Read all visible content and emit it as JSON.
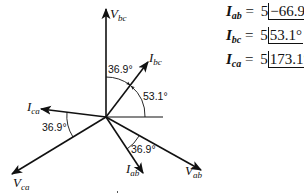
{
  "diagram": {
    "type": "phasor",
    "origin": [
      106,
      117
    ],
    "phasors": [
      {
        "name": "V_bc",
        "var": "V",
        "sub": "bc",
        "tip": [
          106,
          9
        ],
        "label_pos": [
          110,
          18
        ]
      },
      {
        "name": "I_bc",
        "var": "I",
        "sub": "bc",
        "tip": [
          148,
          62
        ],
        "label_pos": [
          148,
          63
        ]
      },
      {
        "name": "I_ca",
        "var": "I",
        "sub": "ca",
        "tip": [
          41,
          109
        ],
        "label_pos": [
          27,
          111
        ]
      },
      {
        "name": "V_ca",
        "var": "V",
        "sub": "ca",
        "tip": [
          12,
          174
        ],
        "label_pos": [
          13,
          189
        ]
      },
      {
        "name": "I_ab",
        "var": "I",
        "sub": "ab",
        "tip": [
          143,
          173
        ],
        "label_pos": [
          125,
          174
        ]
      },
      {
        "name": "V_ab",
        "var": "V",
        "sub": "ab",
        "tip": [
          201,
          170
        ],
        "label_pos": [
          185,
          176
        ]
      }
    ],
    "reference_line_end": [
      163,
      117
    ],
    "angle_labels": [
      {
        "text": "36.9°",
        "pos": [
          108,
          72
        ]
      },
      {
        "text": "53.1°",
        "pos": [
          143,
          100
        ]
      },
      {
        "text": "36.9°",
        "pos": [
          42,
          130
        ]
      },
      {
        "text": "36.9°",
        "pos": [
          131,
          152
        ]
      }
    ]
  },
  "equations": [
    {
      "var": "I",
      "sub": "ab",
      "eq": "=",
      "mag": "5",
      "angle": "−66.9°"
    },
    {
      "var": "I",
      "sub": "bc",
      "eq": "=",
      "mag": "5",
      "angle": "53.1°"
    },
    {
      "var": "I",
      "sub": "ca",
      "eq": "=",
      "mag": "5",
      "angle": "173.1°"
    }
  ]
}
